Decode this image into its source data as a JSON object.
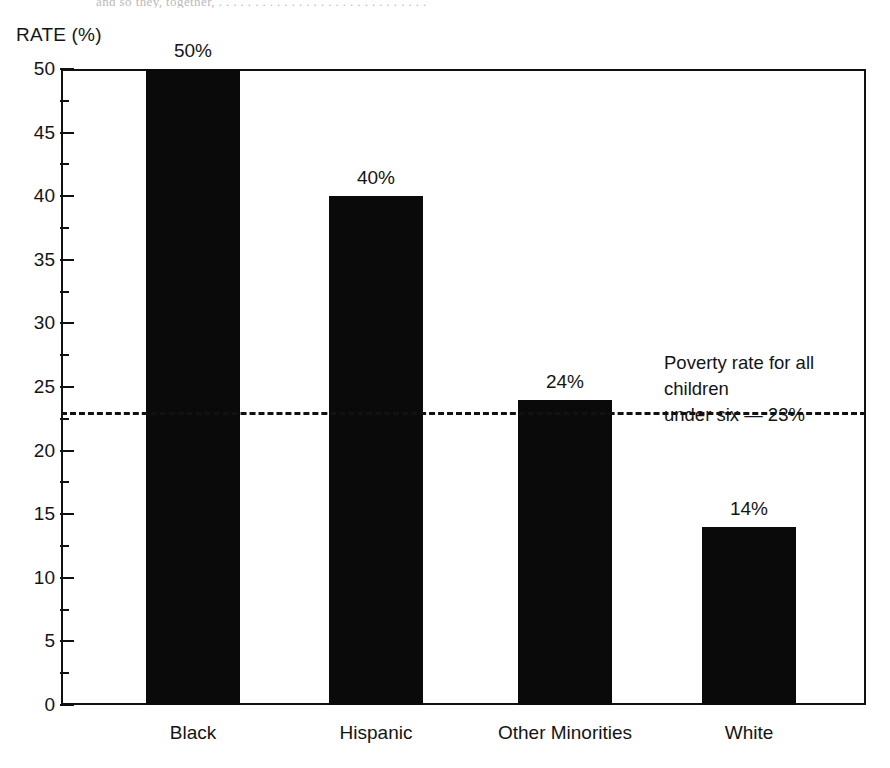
{
  "figure": {
    "top_scan_fragment": "and so they, together,  . . . . . . . . . . . . . . . . . .  . . . . . . . . . . .",
    "axis_title": "RATE (%)"
  },
  "chart_data": {
    "type": "bar",
    "title": "",
    "subtitle": "",
    "xlabel": "",
    "ylabel": "RATE (%)",
    "ylim": [
      0,
      50
    ],
    "yticks": [
      0,
      5,
      10,
      15,
      20,
      25,
      30,
      35,
      40,
      45,
      50
    ],
    "ytick_labels": [
      "0",
      "5",
      "10",
      "15",
      "20",
      "25",
      "30",
      "35",
      "40",
      "45",
      "50"
    ],
    "minor_tick_step": 2.5,
    "grid": false,
    "legend": null,
    "categories": [
      "Black",
      "Hispanic",
      "Other Minorities",
      "White"
    ],
    "values": [
      50,
      40,
      24,
      14
    ],
    "value_labels": [
      "50%",
      "40%",
      "24%",
      "14%"
    ],
    "bar_color": "#0a0a0a",
    "annotations": [
      {
        "type": "reference-line",
        "value": 23,
        "style": "dashed",
        "label_line1": "Poverty rate for all children",
        "label_line2": "under six — 23%",
        "label": "Poverty rate for all children\nunder six — 23%"
      }
    ]
  }
}
